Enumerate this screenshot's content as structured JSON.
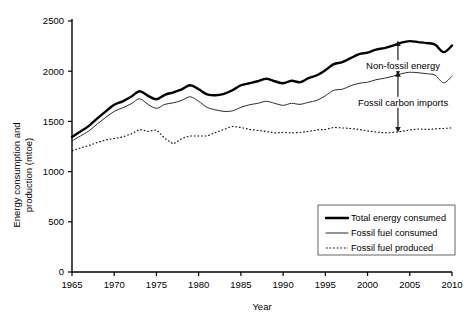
{
  "chart_data": {
    "type": "line",
    "title": "",
    "xlabel": "Year",
    "ylabel": "Energy consumption and production (mtoe)",
    "ylabel_line1": "Energy consumption and",
    "ylabel_line2": "production (mtoe)",
    "xlim": [
      1965,
      2010
    ],
    "ylim": [
      0,
      2500
    ],
    "xticks": [
      1965,
      1970,
      1975,
      1980,
      1985,
      1990,
      1995,
      2000,
      2005,
      2010
    ],
    "yticks": [
      0,
      500,
      1000,
      1500,
      2000,
      2500
    ],
    "grid": false,
    "legend_position": "lower-right",
    "x": [
      1965,
      1966,
      1967,
      1968,
      1969,
      1970,
      1971,
      1972,
      1973,
      1974,
      1975,
      1976,
      1977,
      1978,
      1979,
      1980,
      1981,
      1982,
      1983,
      1984,
      1985,
      1986,
      1987,
      1988,
      1989,
      1990,
      1991,
      1992,
      1993,
      1994,
      1995,
      1996,
      1997,
      1998,
      1999,
      2000,
      2001,
      2002,
      2003,
      2004,
      2005,
      2006,
      2007,
      2008,
      2009,
      2010
    ],
    "series": [
      {
        "name": "Total energy  consumed",
        "style": "thick-solid",
        "color": "#000000",
        "values": [
          1345,
          1400,
          1455,
          1530,
          1600,
          1665,
          1700,
          1745,
          1800,
          1755,
          1720,
          1765,
          1790,
          1820,
          1860,
          1820,
          1770,
          1760,
          1775,
          1810,
          1860,
          1880,
          1900,
          1925,
          1900,
          1880,
          1905,
          1890,
          1930,
          1960,
          2010,
          2070,
          2090,
          2130,
          2170,
          2185,
          2215,
          2230,
          2255,
          2285,
          2300,
          2290,
          2280,
          2265,
          2190,
          2255
        ]
      },
      {
        "name": "Fossil fuel consumed",
        "style": "thin-solid",
        "color": "#2b2b2b",
        "values": [
          1305,
          1355,
          1405,
          1475,
          1540,
          1600,
          1635,
          1675,
          1725,
          1670,
          1630,
          1670,
          1685,
          1710,
          1745,
          1700,
          1640,
          1615,
          1600,
          1605,
          1640,
          1665,
          1680,
          1700,
          1680,
          1660,
          1680,
          1670,
          1690,
          1710,
          1755,
          1810,
          1820,
          1855,
          1880,
          1890,
          1915,
          1930,
          1950,
          1975,
          1990,
          1985,
          1975,
          1960,
          1885,
          1950
        ]
      },
      {
        "name": "Fossil fuel produced",
        "style": "dotted",
        "color": "#000000",
        "values": [
          1205,
          1235,
          1260,
          1290,
          1315,
          1330,
          1345,
          1375,
          1420,
          1400,
          1415,
          1330,
          1275,
          1330,
          1355,
          1355,
          1355,
          1390,
          1420,
          1450,
          1440,
          1420,
          1410,
          1400,
          1385,
          1390,
          1385,
          1390,
          1400,
          1415,
          1420,
          1440,
          1435,
          1430,
          1420,
          1405,
          1395,
          1385,
          1390,
          1400,
          1415,
          1425,
          1420,
          1425,
          1430,
          1435
        ]
      }
    ],
    "annotations": [
      {
        "id": "non-fossil-energy",
        "text": "Non-fossil energy",
        "text_x": 2004.2,
        "text_y": 2055,
        "anchor": "middle",
        "arrow_x": 2003.6,
        "arrow_y_top": 2285,
        "arrow_y_bottom": 1980
      },
      {
        "id": "fossil-carbon-imports",
        "text": "Fossil carbon imports",
        "text_x": 2004.2,
        "text_y": 1690,
        "anchor": "middle",
        "arrow_x": 2003.6,
        "arrow_y_top": 1980,
        "arrow_y_bottom": 1410
      }
    ],
    "legend_entries": [
      {
        "label": "Total energy  consumed",
        "style": "thick-solid"
      },
      {
        "label": "Fossil fuel consumed",
        "style": "thin-solid"
      },
      {
        "label": "Fossil fuel produced",
        "style": "dotted"
      }
    ]
  }
}
